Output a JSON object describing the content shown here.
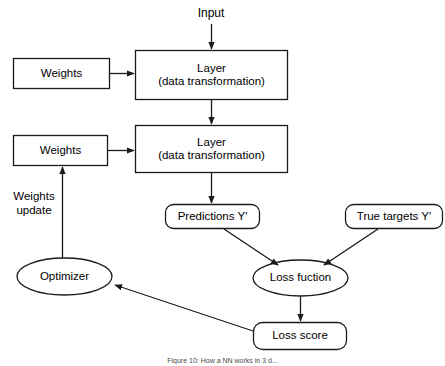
{
  "figure": {
    "caption": "Figure 10: How a NN works in 3 d...",
    "stroke_color": "#1a1a1a",
    "fill_color": "#ffffff",
    "text_color": "#000000",
    "background": "#ffffff"
  },
  "labels": {
    "input": "Input",
    "weights_top": "Weights",
    "weights_bottom": "Weights",
    "layer_top_line1": "Layer",
    "layer_top_line2": "(data transformation)",
    "layer_bottom_line1": "Layer",
    "layer_bottom_line2": "(data transformation)",
    "predictions": "Predictions Y'",
    "true_targets": "True targets Y'",
    "loss_function": "Loss fuction",
    "loss_score": "Loss score",
    "optimizer": "Optimizer",
    "weights_update": "Weights\nupdate"
  },
  "nodes": [
    {
      "id": "weights-top",
      "label": "Weights",
      "shape": "rectangle",
      "x": 13,
      "y": 58,
      "w": 97,
      "h": 31
    },
    {
      "id": "layer-top",
      "label": "Layer\n(data transformation)",
      "shape": "rectangle",
      "x": 135,
      "y": 50,
      "w": 153,
      "h": 50
    },
    {
      "id": "weights-bottom",
      "label": "Weights",
      "shape": "rectangle",
      "x": 13,
      "y": 135,
      "w": 95,
      "h": 31
    },
    {
      "id": "layer-bottom",
      "label": "Layer\n(data transformation)",
      "shape": "rectangle",
      "x": 135,
      "y": 125,
      "w": 153,
      "h": 48
    },
    {
      "id": "predictions",
      "label": "Predictions Y'",
      "shape": "rounded-rectangle",
      "x": 165,
      "y": 204,
      "w": 95,
      "h": 25
    },
    {
      "id": "true-targets",
      "label": "True targets Y'",
      "shape": "rounded-rectangle",
      "x": 345,
      "y": 204,
      "w": 98,
      "h": 25
    },
    {
      "id": "loss-function",
      "label": "Loss fuction",
      "shape": "ellipse",
      "x": 253,
      "y": 260,
      "w": 95,
      "h": 36
    },
    {
      "id": "loss-score",
      "label": "Loss score",
      "shape": "rounded-rectangle",
      "x": 253,
      "y": 322,
      "w": 94,
      "h": 28
    },
    {
      "id": "optimizer",
      "label": "Optimizer",
      "shape": "ellipse",
      "x": 17,
      "y": 258,
      "w": 95,
      "h": 37
    }
  ],
  "edges": [
    {
      "id": "input-to-layer-top",
      "from": "input",
      "to": "layer-top",
      "arrow": true
    },
    {
      "id": "weights-top-to-layer-top",
      "from": "weights-top",
      "to": "layer-top",
      "arrow": true
    },
    {
      "id": "layer-top-to-layer-bottom",
      "from": "layer-top",
      "to": "layer-bottom",
      "arrow": true
    },
    {
      "id": "weights-bottom-to-layer-bottom",
      "from": "weights-bottom",
      "to": "layer-bottom",
      "arrow": true
    },
    {
      "id": "layer-bottom-to-predictions",
      "from": "layer-bottom",
      "to": "predictions",
      "arrow": true
    },
    {
      "id": "predictions-to-loss-function",
      "from": "predictions",
      "to": "loss-function",
      "arrow": true
    },
    {
      "id": "true-targets-to-loss-function",
      "from": "true-targets",
      "to": "loss-function",
      "arrow": true
    },
    {
      "id": "loss-function-to-loss-score",
      "from": "loss-function",
      "to": "loss-score",
      "arrow": true
    },
    {
      "id": "loss-score-to-optimizer",
      "from": "loss-score",
      "to": "optimizer",
      "arrow": true
    },
    {
      "id": "optimizer-to-weights-bottom",
      "from": "optimizer",
      "to": "weights-bottom",
      "arrow": true
    }
  ]
}
